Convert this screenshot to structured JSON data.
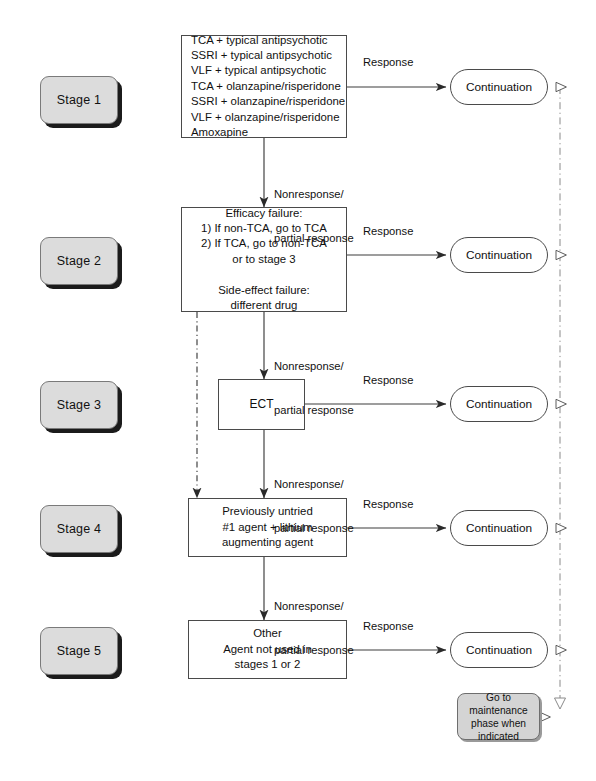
{
  "diagram": {
    "background": "#ffffff",
    "line_color": "#3c3c3c",
    "stage_fill": "#dcdcdc",
    "note_fill": "#d4d4d4"
  },
  "stages": [
    {
      "id": "stage-1",
      "label": "Stage 1"
    },
    {
      "id": "stage-2",
      "label": "Stage 2"
    },
    {
      "id": "stage-3",
      "label": "Stage 3"
    },
    {
      "id": "stage-4",
      "label": "Stage 4"
    },
    {
      "id": "stage-5",
      "label": "Stage 5"
    }
  ],
  "boxes": {
    "stage1": {
      "lines": [
        "TCA + typical antipsychotic",
        "SSRI + typical antipsychotic",
        "VLF + typical antipsychotic",
        "TCA + olanzapine/risperidone",
        "SSRI + olanzapine/risperidone",
        "VLF + olanzapine/risperidone",
        "Amoxapine"
      ]
    },
    "stage2": {
      "lines": [
        "Efficacy failure:",
        "1) If non-TCA, go to TCA",
        "2) If TCA, go to non-TCA",
        "or to stage 3",
        "",
        "Side-effect failure:",
        "different drug"
      ]
    },
    "stage3": {
      "lines": [
        "ECT"
      ]
    },
    "stage4": {
      "lines": [
        "Previously untried",
        "#1 agent + lithium",
        "augmenting agent"
      ]
    },
    "stage5": {
      "lines": [
        "Other",
        "Agent not used in",
        "stages 1 or 2"
      ]
    }
  },
  "outcomes": [
    {
      "id": "continuation-1",
      "label": "Continuation"
    },
    {
      "id": "continuation-2",
      "label": "Continuation"
    },
    {
      "id": "continuation-3",
      "label": "Continuation"
    },
    {
      "id": "continuation-4",
      "label": "Continuation"
    },
    {
      "id": "continuation-5",
      "label": "Continuation"
    }
  ],
  "maintenance_note": {
    "lines": [
      "Go to maintenance",
      "phase when",
      "indicated"
    ]
  },
  "edge_labels": {
    "response": "Response",
    "nonresponse_line1": "Nonresponse/",
    "nonresponse_line2": "partial response"
  }
}
